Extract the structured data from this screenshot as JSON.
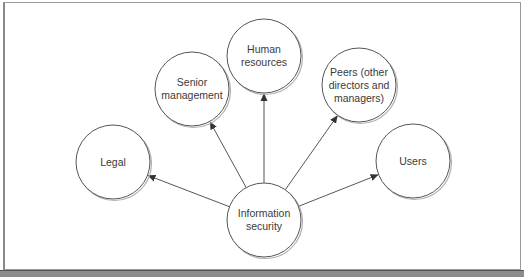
{
  "diagram": {
    "center_node": {
      "id": "infosec",
      "label": "Information security",
      "lines": [
        "Information",
        "security"
      ],
      "cx": 264,
      "cy": 220
    },
    "nodes": [
      {
        "id": "legal",
        "label": "Legal",
        "cx": 113,
        "cy": 162
      },
      {
        "id": "senior",
        "label": "Senior management",
        "cx": 192,
        "cy": 89
      },
      {
        "id": "hr",
        "label": "Human resources",
        "cx": 264,
        "cy": 56
      },
      {
        "id": "peers",
        "label": "Peers (other directors and managers)",
        "cx": 359,
        "cy": 85
      },
      {
        "id": "users",
        "label": "Users",
        "cx": 413,
        "cy": 161
      }
    ],
    "radius": 37,
    "edges": [
      {
        "from": "infosec",
        "to": "legal"
      },
      {
        "from": "infosec",
        "to": "senior"
      },
      {
        "from": "infosec",
        "to": "hr"
      },
      {
        "from": "infosec",
        "to": "peers"
      },
      {
        "from": "infosec",
        "to": "users"
      }
    ],
    "colors": {
      "stroke": "#555555",
      "text": "#3a3a3a",
      "shadow": "#b0b0b0"
    }
  },
  "labels": {
    "legal": "Legal",
    "senior": "Senior management",
    "hr": "Human resources",
    "peers": "Peers (other directors and managers)",
    "users": "Users",
    "infosec": "Information security"
  }
}
